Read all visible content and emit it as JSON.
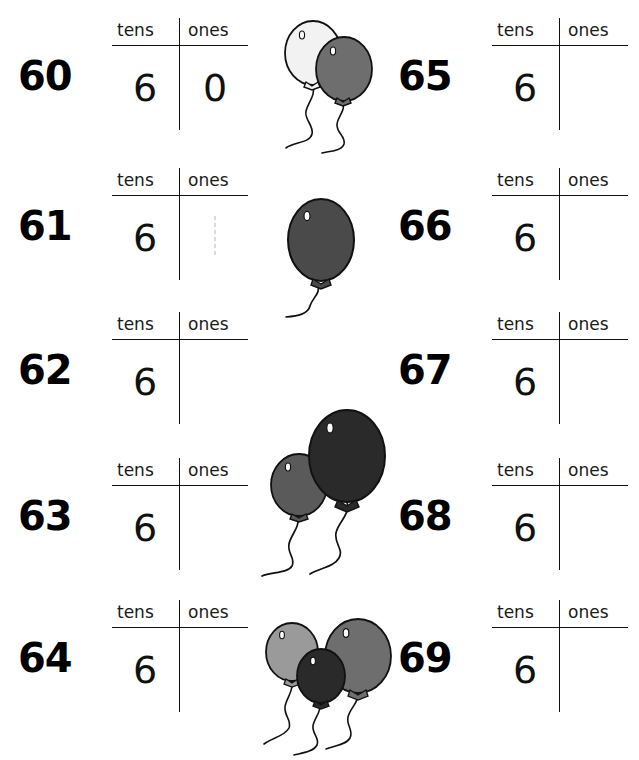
{
  "worksheet": {
    "title": "Place Value Tens and Ones Worksheet 60-69",
    "column_headers": {
      "tens": "tens",
      "ones": "ones"
    },
    "background_color": "#ffffff",
    "ink_color": "#000000"
  },
  "columns": {
    "left": {
      "rows": [
        {
          "number": "60",
          "tens": "6",
          "ones": "0",
          "ones_filled": true,
          "ghost": false
        },
        {
          "number": "61",
          "tens": "6",
          "ones": "",
          "ones_filled": false,
          "ghost": true
        },
        {
          "number": "62",
          "tens": "6",
          "ones": "",
          "ones_filled": false,
          "ghost": false
        },
        {
          "number": "63",
          "tens": "6",
          "ones": "",
          "ones_filled": false,
          "ghost": false
        },
        {
          "number": "64",
          "tens": "6",
          "ones": "",
          "ones_filled": false,
          "ghost": false
        }
      ]
    },
    "right": {
      "rows": [
        {
          "number": "65",
          "tens": "6",
          "ones": "",
          "ones_filled": false,
          "ghost": false
        },
        {
          "number": "66",
          "tens": "6",
          "ones": "",
          "ones_filled": false,
          "ghost": false
        },
        {
          "number": "67",
          "tens": "6",
          "ones": "",
          "ones_filled": false,
          "ghost": false
        },
        {
          "number": "68",
          "tens": "6",
          "ones": "",
          "ones_filled": false,
          "ghost": false
        },
        {
          "number": "69",
          "tens": "6",
          "ones": "",
          "ones_filled": false,
          "ghost": false
        }
      ]
    }
  },
  "artwork": {
    "clusters": [
      {
        "name": "balloon-cluster-two-top",
        "count": 2,
        "balloon_colors": [
          "#f2f2f2",
          "#6e6e6e"
        ],
        "outline_color": "#000000"
      },
      {
        "name": "balloon-cluster-single",
        "count": 1,
        "balloon_colors": [
          "#4a4a4a"
        ],
        "outline_color": "#000000"
      },
      {
        "name": "balloon-cluster-two-middle",
        "count": 2,
        "balloon_colors": [
          "#5a5a5a",
          "#2a2a2a"
        ],
        "outline_color": "#000000"
      },
      {
        "name": "balloon-cluster-three-bottom",
        "count": 3,
        "balloon_colors": [
          "#9a9a9a",
          "#2a2a2a",
          "#6e6e6e"
        ],
        "outline_color": "#000000"
      }
    ]
  }
}
